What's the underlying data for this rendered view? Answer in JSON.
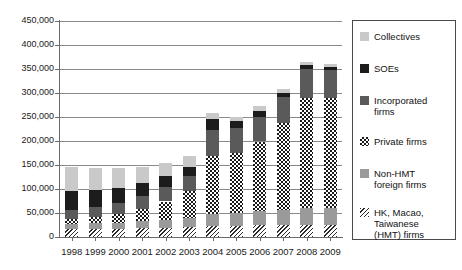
{
  "chart_data": {
    "type": "bar",
    "subtype": "stacked-bar",
    "title": "",
    "xlabel": "",
    "ylabel": "",
    "ylim": [
      0,
      450000
    ],
    "ytick_step": 50000,
    "grid": true,
    "legend_position": "right",
    "categories": [
      "1998",
      "1999",
      "2000",
      "2001",
      "2002",
      "2003",
      "2004",
      "2005",
      "2006",
      "2007",
      "2008",
      "2009"
    ],
    "ytick_labels": [
      "450,000",
      "400,000",
      "350,000",
      "300,000",
      "250,000",
      "200,000",
      "150,000",
      "100,000",
      "50,000",
      "0"
    ],
    "ytick_values": [
      450000,
      400000,
      350000,
      300000,
      250000,
      200000,
      150000,
      100000,
      50000,
      0
    ],
    "stack_order_bottom_to_top": [
      "HK, Macao, Taiwanese (HMT) firms",
      "Non-HMT foreign firms",
      "Private firms",
      "Incorporated firms",
      "SOEs",
      "Collectives"
    ],
    "series": [
      {
        "name": "HK, Macao, Taiwanese (HMT) firms",
        "fill": "diagonal-hatch",
        "color": "#2a2a2a",
        "values": [
          16000,
          16500,
          17000,
          18000,
          19000,
          20000,
          22000,
          23000,
          24000,
          25000,
          26000,
          26000
        ]
      },
      {
        "name": "Non-HMT foreign firms",
        "fill": "solid-medium-gray",
        "color": "#9a9a9a",
        "values": [
          11000,
          12000,
          13000,
          15000,
          17000,
          20000,
          26000,
          28000,
          30000,
          32000,
          34000,
          34000
        ]
      },
      {
        "name": "Private firms",
        "fill": "checkerboard",
        "color": "#181818",
        "values": [
          11000,
          13000,
          17000,
          25000,
          38000,
          55000,
          120000,
          125000,
          145000,
          180000,
          230000,
          230000
        ]
      },
      {
        "name": "Incorporated firms",
        "fill": "solid-dark-gray",
        "color": "#5a5a5a",
        "values": [
          19000,
          21000,
          24000,
          27000,
          30000,
          33000,
          55000,
          52000,
          52000,
          55000,
          60000,
          58000
        ]
      },
      {
        "name": "SOEs",
        "fill": "solid-black",
        "color": "#1c1c1c",
        "values": [
          39000,
          36000,
          32000,
          28000,
          23000,
          18000,
          23000,
          13000,
          12000,
          9000,
          8000,
          7000
        ]
      },
      {
        "name": "Collectives",
        "fill": "solid-light-gray",
        "color": "#c9c9c9",
        "values": [
          50000,
          45000,
          40000,
          32000,
          27000,
          22000,
          12000,
          10000,
          9000,
          8000,
          7000,
          6000
        ]
      }
    ],
    "totals": [
      146000,
      143500,
      143000,
      145000,
      154000,
      168000,
      258000,
      251000,
      272000,
      309000,
      365000,
      361000
    ]
  },
  "legend": {
    "items": [
      {
        "label": "Collectives",
        "swatch": "collectives-swatch"
      },
      {
        "label": "SOEs",
        "swatch": "soes-swatch"
      },
      {
        "label": "Incorporated\nfirms",
        "swatch": "incorporated-swatch"
      },
      {
        "label": "Private firms",
        "swatch": "private-swatch"
      },
      {
        "label": "Non-HMT\nforeign firms",
        "swatch": "nonhmt-swatch"
      },
      {
        "label": "HK, Macao,\nTaiwanese\n(HMT) firms",
        "swatch": "hmt-swatch"
      }
    ]
  }
}
